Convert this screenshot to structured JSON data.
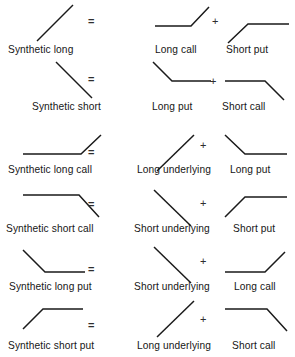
{
  "figure": {
    "type": "diagram",
    "width": 295,
    "height": 357,
    "background_color": "#ffffff",
    "stroke_color": "#1a1a1a",
    "text_color": "#161616",
    "operators": {
      "equals": "=",
      "plus": "+"
    },
    "rows": [
      {
        "id": "synthetic-long",
        "result": {
          "label": "Synthetic long",
          "shape": "rising-diagonal",
          "label_x": 8,
          "label_y": 44,
          "glyph_x": 34,
          "glyph_y": 2,
          "points": "2,38 38,2"
        },
        "operator_equals": {
          "x": 88,
          "y": 16
        },
        "legs": [
          {
            "label": "Long call",
            "shape": "flat-then-rising",
            "label_x": 155,
            "label_y": 44,
            "glyph_x": 154,
            "glyph_y": 4,
            "points": "0,21 36,21 54,2"
          },
          {
            "label": "Short put",
            "shape": "rising-then-flat",
            "label_x": 226,
            "label_y": 44,
            "glyph_x": 227,
            "glyph_y": 21,
            "points": "0,21 20,2 61,2"
          }
        ],
        "operator_plus": {
          "x": 212,
          "y": 16
        }
      },
      {
        "id": "synthetic-short",
        "result": {
          "label": "Synthetic short",
          "shape": "falling-diagonal",
          "label_x": 32,
          "label_y": 101,
          "glyph_x": 55,
          "glyph_y": 61,
          "points": "0,0 36,36"
        },
        "operator_equals": {
          "x": 88,
          "y": 74
        },
        "legs": [
          {
            "label": "Long put",
            "shape": "falling-then-flat",
            "label_x": 152,
            "label_y": 101,
            "glyph_x": 152,
            "glyph_y": 61,
            "points": "0,0 19,19 58,19"
          },
          {
            "label": "Short call",
            "shape": "flat-then-falling",
            "label_x": 222,
            "label_y": 101,
            "glyph_x": 224,
            "glyph_y": 80,
            "points": "0,0 40,0 59,19"
          }
        ],
        "operator_plus": {
          "x": 210,
          "y": 76
        }
      },
      {
        "id": "synthetic-long-call",
        "result": {
          "label": "Synthetic long call",
          "shape": "flat-then-rising",
          "label_x": 8,
          "label_y": 164,
          "glyph_x": 22,
          "glyph_y": 134,
          "points": "0,19 58,19 78,0"
        },
        "operator_equals": {
          "x": 88,
          "y": 147
        },
        "legs": [
          {
            "label": "Long underlying",
            "shape": "rising-diagonal",
            "label_x": 137,
            "label_y": 164,
            "glyph_x": 156,
            "glyph_y": 134,
            "points": "0,36 37,0"
          },
          {
            "label": "Long put",
            "shape": "falling-then-flat",
            "label_x": 230,
            "label_y": 164,
            "glyph_x": 224,
            "glyph_y": 134,
            "points": "0,0 20,19 62,19"
          }
        ],
        "operator_plus": {
          "x": 200,
          "y": 140
        }
      },
      {
        "id": "synthetic-short-call",
        "result": {
          "label": "Synthetic short call",
          "shape": "flat-then-falling",
          "label_x": 6,
          "label_y": 223,
          "glyph_x": 22,
          "glyph_y": 194,
          "points": "0,0 56,0 76,22"
        },
        "operator_equals": {
          "x": 88,
          "y": 199
        },
        "legs": [
          {
            "label": "Short underlying",
            "shape": "falling-diagonal",
            "label_x": 134,
            "label_y": 223,
            "glyph_x": 153,
            "glyph_y": 189,
            "points": "0,0 37,36"
          },
          {
            "label": "Short put",
            "shape": "rising-then-flat",
            "label_x": 233,
            "label_y": 223,
            "glyph_x": 224,
            "glyph_y": 194,
            "points": "0,22 20,2 62,2"
          }
        ],
        "operator_plus": {
          "x": 200,
          "y": 198
        }
      },
      {
        "id": "synthetic-long-put",
        "result": {
          "label": "Synthetic long put",
          "shape": "falling-then-flat",
          "label_x": 9,
          "label_y": 281,
          "glyph_x": 22,
          "glyph_y": 249,
          "points": "0,0 22,22 62,22"
        },
        "operator_equals": {
          "x": 88,
          "y": 264
        },
        "legs": [
          {
            "label": "Short underlying",
            "shape": "falling-diagonal",
            "label_x": 134,
            "label_y": 281,
            "glyph_x": 153,
            "glyph_y": 246,
            "points": "0,0 37,36"
          },
          {
            "label": "Long call",
            "shape": "flat-then-rising",
            "label_x": 234,
            "label_y": 281,
            "glyph_x": 224,
            "glyph_y": 249,
            "points": "0,22 40,22 60,2"
          }
        ],
        "operator_plus": {
          "x": 200,
          "y": 256
        }
      },
      {
        "id": "synthetic-short-put",
        "result": {
          "label": "Synthetic short put",
          "shape": "rising-then-flat",
          "label_x": 8,
          "label_y": 340,
          "glyph_x": 22,
          "glyph_y": 306,
          "points": "0,22 20,2 60,2"
        },
        "operator_equals": {
          "x": 88,
          "y": 320
        },
        "legs": [
          {
            "label": "Long underlying",
            "shape": "rising-diagonal",
            "label_x": 137,
            "label_y": 340,
            "glyph_x": 156,
            "glyph_y": 300,
            "points": "0,36 37,0"
          },
          {
            "label": "Short call",
            "shape": "flat-then-falling",
            "label_x": 232,
            "label_y": 340,
            "glyph_x": 224,
            "glyph_y": 306,
            "points": "0,2 42,2 62,24"
          }
        ],
        "operator_plus": {
          "x": 200,
          "y": 314
        }
      }
    ]
  }
}
